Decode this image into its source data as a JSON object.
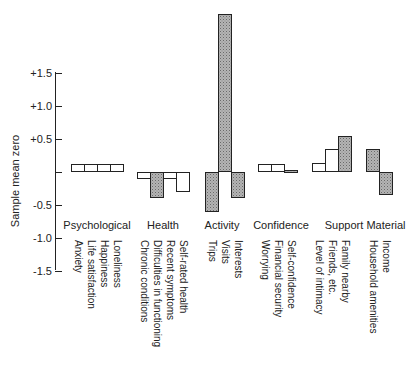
{
  "chart_data": {
    "type": "bar",
    "title": "",
    "xlabel": "",
    "ylabel": "Sample mean zero",
    "ylim": [
      -1.5,
      1.5
    ],
    "yticks": [
      "+1.5",
      "+1.0",
      "+0.5",
      "",
      "-0.5",
      "-1.0",
      "-1.5"
    ],
    "ytick_values": [
      1.5,
      1.0,
      0.5,
      0,
      -0.5,
      -1.0,
      -1.5
    ],
    "grid": false,
    "legend": null,
    "groups": [
      {
        "name": "Psychological",
        "items": [
          {
            "label": "Anxiety",
            "value": 0.12,
            "shaded": false
          },
          {
            "label": "Life satisfaction",
            "value": 0.12,
            "shaded": false
          },
          {
            "label": "Happiness",
            "value": 0.12,
            "shaded": false
          },
          {
            "label": "Loneliness",
            "value": 0.12,
            "shaded": false
          }
        ]
      },
      {
        "name": "Health",
        "items": [
          {
            "label": "Chronic conditions",
            "value": -0.1,
            "shaded": false
          },
          {
            "label": "Difficulties in functioning",
            "value": -0.4,
            "shaded": true
          },
          {
            "label": "Recent symptoms",
            "value": -0.1,
            "shaded": false
          },
          {
            "label": "Self-rated health",
            "value": -0.3,
            "shaded": false
          }
        ]
      },
      {
        "name": "Activity",
        "items": [
          {
            "label": "Trips",
            "value": -0.6,
            "shaded": true
          },
          {
            "label": "Visits",
            "value": 2.4,
            "shaded": true
          },
          {
            "label": "Interests",
            "value": -0.4,
            "shaded": true
          }
        ]
      },
      {
        "name": "Confidence",
        "items": [
          {
            "label": "Worrying",
            "value": 0.12,
            "shaded": false
          },
          {
            "label": "Financial security",
            "value": 0.12,
            "shaded": false
          },
          {
            "label": "Self-confidence",
            "value": 0.03,
            "shaded": true
          }
        ]
      },
      {
        "name": "Support",
        "items": [
          {
            "label": "Level of intimacy",
            "value": 0.13,
            "shaded": false
          },
          {
            "label": "Friends, etc.",
            "value": 0.35,
            "shaded": false
          },
          {
            "label": "Family nearby",
            "value": 0.55,
            "shaded": true
          }
        ]
      },
      {
        "name": "Material",
        "items": [
          {
            "label": "Household amenities",
            "value": 0.35,
            "shaded": true
          },
          {
            "label": "Income",
            "value": -0.35,
            "shaded": true
          }
        ]
      }
    ]
  },
  "colors": {
    "axis": "#222222",
    "bar_border": "#222222",
    "bar_plain": "#ffffff",
    "bar_shaded": "#b4b4b4"
  }
}
